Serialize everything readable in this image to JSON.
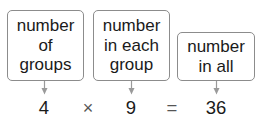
{
  "diagram": {
    "labels": [
      {
        "id": "groups",
        "lines": [
          "number",
          "of",
          "groups"
        ]
      },
      {
        "id": "each",
        "lines": [
          "number",
          "in each",
          "group"
        ]
      },
      {
        "id": "all",
        "lines": [
          "number",
          "in all"
        ]
      }
    ],
    "equation": {
      "factor1": "4",
      "operator": "×",
      "factor2": "9",
      "equals": "=",
      "product": "36"
    },
    "colors": {
      "box_border": "#8c8c8c",
      "arrow": "#9a9a9a",
      "text": "#1a1a1a"
    }
  }
}
